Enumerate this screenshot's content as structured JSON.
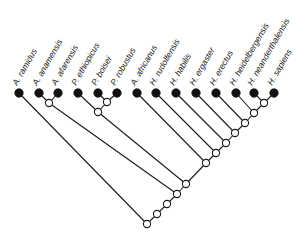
{
  "diagram": {
    "type": "cladogram",
    "title": "",
    "colors": {
      "line": "#1a1a1a",
      "leaf": "#111111",
      "internal_node": "#ffffff"
    },
    "taxa": [
      {
        "id": "t0",
        "label": "A. ramidus",
        "x": 19,
        "y": 93
      },
      {
        "id": "t1",
        "label": "A. anamensis",
        "x": 39,
        "y": 93
      },
      {
        "id": "t2",
        "label": "A. afarensis",
        "x": 58,
        "y": 93
      },
      {
        "id": "t3",
        "label": "P. ethiopicus",
        "x": 78,
        "y": 93
      },
      {
        "id": "t4",
        "label": "P. boisei",
        "x": 98,
        "y": 93
      },
      {
        "id": "t5",
        "label": "P. robustus",
        "x": 117,
        "y": 93
      },
      {
        "id": "t6",
        "label": "A. africanus",
        "x": 137,
        "y": 93
      },
      {
        "id": "t7",
        "label": "H. rudolfensis",
        "x": 156,
        "y": 93
      },
      {
        "id": "t8",
        "label": "H. habilis",
        "x": 176,
        "y": 93
      },
      {
        "id": "t9",
        "label": "H. ergaster",
        "x": 196,
        "y": 93
      },
      {
        "id": "t10",
        "label": "H. erectus",
        "x": 216,
        "y": 93
      },
      {
        "id": "t11",
        "label": "H. heidelbergensis",
        "x": 236,
        "y": 93
      },
      {
        "id": "t12",
        "label": "H. neanderthalensis",
        "x": 254,
        "y": 93
      },
      {
        "id": "t13",
        "label": "H. sapiens",
        "x": 274,
        "y": 93
      }
    ],
    "internal_nodes": [
      {
        "id": "n_anam_afar",
        "x": 49,
        "y": 103,
        "children": [
          "t1",
          "t2"
        ]
      },
      {
        "id": "n_bois_rob",
        "x": 107,
        "y": 102,
        "children": [
          "t4",
          "t5"
        ]
      },
      {
        "id": "n_paran",
        "x": 98,
        "y": 112,
        "children": [
          "t3",
          "n_bois_rob"
        ]
      },
      {
        "id": "n_nean_sap",
        "x": 264,
        "y": 103,
        "children": [
          "t12",
          "t13"
        ]
      },
      {
        "id": "n_heid",
        "x": 254,
        "y": 113,
        "children": [
          "t11",
          "n_nean_sap"
        ]
      },
      {
        "id": "n_erec",
        "x": 245,
        "y": 123,
        "children": [
          "t10",
          "n_heid"
        ]
      },
      {
        "id": "n_ergas",
        "x": 235,
        "y": 133,
        "children": [
          "t9",
          "n_erec"
        ]
      },
      {
        "id": "n_habil",
        "x": 226,
        "y": 143,
        "children": [
          "t8",
          "n_ergas"
        ]
      },
      {
        "id": "n_rudol",
        "x": 216,
        "y": 153,
        "children": [
          "t7",
          "n_habil"
        ]
      },
      {
        "id": "n_afric",
        "x": 206,
        "y": 163,
        "children": [
          "t6",
          "n_rudol"
        ]
      },
      {
        "id": "n_paran_join",
        "x": 186,
        "y": 184,
        "children": [
          "n_paran",
          "n_afric"
        ]
      },
      {
        "id": "n_afar_join",
        "x": 177,
        "y": 194,
        "children": [
          "n_anam_afar",
          "n_paran_join"
        ]
      },
      {
        "id": "n_a",
        "x": 167,
        "y": 204,
        "children": [
          "n_afar_join"
        ]
      },
      {
        "id": "n_b",
        "x": 157,
        "y": 214,
        "children": [
          "n_a"
        ]
      },
      {
        "id": "root",
        "x": 147,
        "y": 224,
        "children": [
          "t0",
          "n_b"
        ]
      }
    ]
  }
}
